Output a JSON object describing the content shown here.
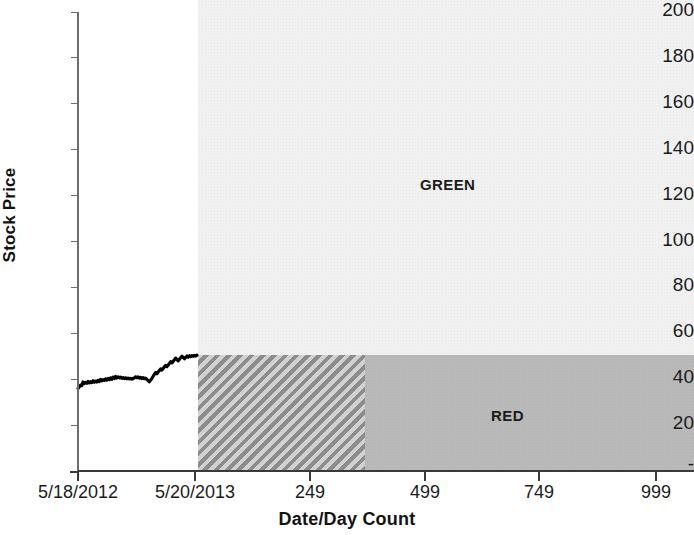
{
  "chart_data": {
    "type": "line",
    "title": "",
    "xlabel": "Date/Day Count",
    "ylabel": "Stock Price",
    "ylim": [
      0,
      200
    ],
    "grid": false,
    "legend_position": "none",
    "y_ticks": [
      {
        "label": "200",
        "value": 200
      },
      {
        "label": "180",
        "value": 180
      },
      {
        "label": "160",
        "value": 160
      },
      {
        "label": "140",
        "value": 140
      },
      {
        "label": "120",
        "value": 120
      },
      {
        "label": "100",
        "value": 100
      },
      {
        "label": "80",
        "value": 80
      },
      {
        "label": "60",
        "value": 60
      },
      {
        "label": "40",
        "value": 40
      },
      {
        "label": "20",
        "value": 20
      },
      {
        "label": "-",
        "value": 0
      }
    ],
    "x_ticks": [
      {
        "label": "5/18/2012",
        "value": 0
      },
      {
        "label": "5/20/2013",
        "value": 1
      },
      {
        "label": "249",
        "value": 249
      },
      {
        "label": "499",
        "value": 499
      },
      {
        "label": "749",
        "value": 749
      },
      {
        "label": "999",
        "value": 999
      }
    ],
    "series": [
      {
        "name": "Stock Price",
        "color": "#000000",
        "values": [
          36.0,
          36.6,
          37.4,
          37.2,
          38.8,
          38.1,
          38.6,
          38.2,
          39.0,
          38.4,
          38.9,
          38.5,
          39.3,
          38.7,
          39.2,
          38.8,
          39.5,
          39.0,
          39.9,
          39.3,
          39.8,
          39.4,
          40.1,
          39.6,
          40.3,
          39.8,
          40.6,
          40.0,
          40.9,
          40.3,
          41.2,
          40.5,
          41.0,
          40.6,
          40.9,
          40.4,
          40.7,
          40.3,
          40.6,
          40.2,
          40.5,
          40.1,
          40.4,
          40.0,
          40.3,
          40.6,
          41.0,
          40.6,
          41.0,
          40.5,
          40.8,
          40.3,
          40.7,
          40.2,
          40.5,
          39.9,
          39.4,
          38.9,
          39.6,
          40.4,
          41.3,
          42.2,
          42.9,
          42.4,
          43.1,
          43.8,
          44.5,
          44.0,
          44.7,
          45.4,
          46.0,
          45.5,
          46.2,
          46.9,
          47.6,
          47.1,
          47.8,
          48.5,
          49.2,
          48.6,
          48.0,
          48.7,
          49.4,
          50.0,
          49.5,
          48.9,
          49.5,
          50.1,
          49.6,
          50.2,
          49.8,
          50.3,
          50.0,
          50.4,
          50.1,
          50.5
        ]
      }
    ],
    "regions": [
      {
        "name": "GREEN",
        "label": "GREEN",
        "fill": "#f1f1f1",
        "x_from": 1,
        "x_to": 999,
        "y_from": 50,
        "y_to": 200
      },
      {
        "name": "RED",
        "label": "RED",
        "fill": "#b9b9b9",
        "x_from": 249,
        "x_to": 999,
        "y_from": 0,
        "y_to": 50
      },
      {
        "name": "HATCHED",
        "label": "",
        "fill": "hatched",
        "x_from": 1,
        "x_to": 249,
        "y_from": 0,
        "y_to": 50
      }
    ]
  },
  "axes": {
    "x_title": "Date/Day Count",
    "y_title": "Stock Price"
  },
  "labels": {
    "green": "GREEN",
    "red": "RED"
  }
}
